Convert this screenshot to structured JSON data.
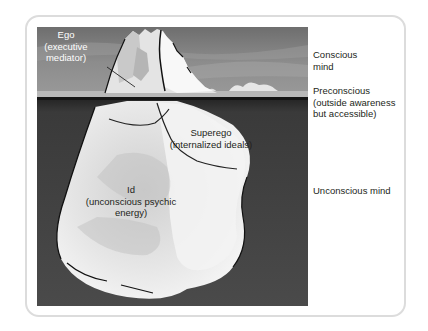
{
  "diagram": {
    "iceberg_labels": {
      "ego": {
        "line1": "Ego",
        "line2": "(executive",
        "line3": "mediator)"
      },
      "superego": {
        "line1": "Superego",
        "line2": "(internalized ideals)"
      },
      "id": {
        "line1": "Id",
        "line2": "(unconscious psychic",
        "line3": "energy)"
      }
    },
    "levels": {
      "conscious": {
        "line1": "Conscious",
        "line2": "mind"
      },
      "preconscious": {
        "line1": "Preconscious",
        "line2": "(outside awareness",
        "line3": "but accessible)"
      },
      "unconscious": {
        "line1": "Unconscious mind"
      }
    },
    "colors": {
      "sky": "#8a8a8a",
      "water_dark": "#3c3c3c",
      "ice_light": "#f2f2f2",
      "ice_shadow": "#c4c4c4",
      "frame_border": "#dcdcdc",
      "text": "#231f20"
    }
  }
}
